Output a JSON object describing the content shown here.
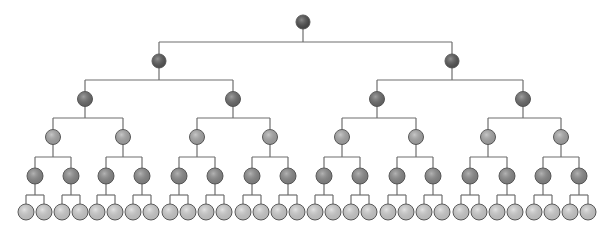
{
  "diagram": {
    "type": "complete-binary-tree",
    "depth": 6,
    "nodes_per_level": [
      1,
      2,
      4,
      8,
      16,
      32
    ],
    "total_nodes": 63,
    "levels": [
      {
        "level": 0,
        "y": 22,
        "radius": 7,
        "fill": "#4a4a4a",
        "bus_y": 42,
        "x": [
          303
        ]
      },
      {
        "level": 1,
        "y": 61,
        "radius": 7,
        "fill": "#555555",
        "bus_y": 80,
        "x": [
          159,
          452
        ]
      },
      {
        "level": 2,
        "y": 99,
        "radius": 7.5,
        "fill": "#6b6b6b",
        "bus_y": 118,
        "x": [
          85,
          233,
          377,
          523
        ]
      },
      {
        "level": 3,
        "y": 137,
        "radius": 7.5,
        "fill": "#a9a9a9",
        "bus_y": 157,
        "x": [
          53,
          123,
          197,
          270,
          342,
          416,
          488,
          561
        ]
      },
      {
        "level": 4,
        "y": 176,
        "radius": 8,
        "fill": "#8a8a8a",
        "bus_y": 195,
        "x": [
          35,
          71,
          106,
          142,
          179,
          215,
          252,
          288,
          324,
          360,
          397,
          433,
          470,
          507,
          543,
          579
        ]
      },
      {
        "level": 5,
        "y": 212,
        "radius": 8,
        "fill": "#d2d2d2",
        "bus_y": null,
        "x": [
          26,
          44,
          62,
          80,
          97,
          115,
          133,
          151,
          170,
          188,
          206,
          224,
          243,
          261,
          279,
          297,
          315,
          333,
          351,
          369,
          388,
          406,
          424,
          442,
          461,
          479,
          497,
          515,
          534,
          552,
          570,
          588
        ]
      }
    ],
    "colors": {
      "edge": "#6e6e6e",
      "node_stroke": "#5a5a5a",
      "background": "#ffffff"
    }
  }
}
